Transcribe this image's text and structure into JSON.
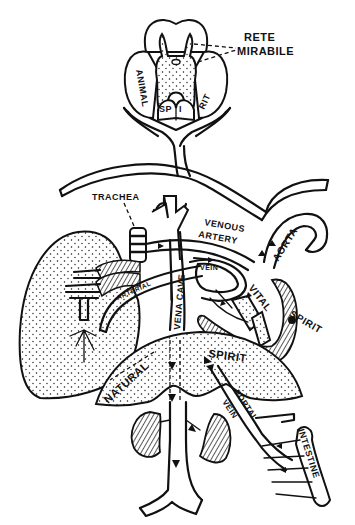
{
  "diagram": {
    "colors": {
      "ink": "#111111",
      "paper": "#ffffff"
    },
    "labels": {
      "rete_line1": "RETE",
      "rete_line2": "MIRABILE",
      "brain_animal": "ANIMAL",
      "brain_sp": "SP",
      "brain_i": "I",
      "brain_rit": "RIT",
      "trachea": "TRACHEA",
      "venous_line1": "VENOUS",
      "venous_line2": "ARTERY",
      "aorta": "AORTA",
      "vena_cave": "VENA CAVE",
      "vein": "VEIN",
      "arterial": "ARTERIAL",
      "vital": "VITAL",
      "spirit_heart": "SPIRIT",
      "natural": "NATURAL",
      "spirit_liver": "SPIRIT",
      "portal": "PORTAL",
      "portal_vein": "VEIN",
      "intestine": "INTESTINE"
    },
    "structures": [
      "brain",
      "rete-mirabile",
      "trachea",
      "lung",
      "heart",
      "aorta",
      "vena-cava",
      "pulmonary-vein",
      "liver",
      "kidneys",
      "portal-vein",
      "intestine"
    ]
  }
}
